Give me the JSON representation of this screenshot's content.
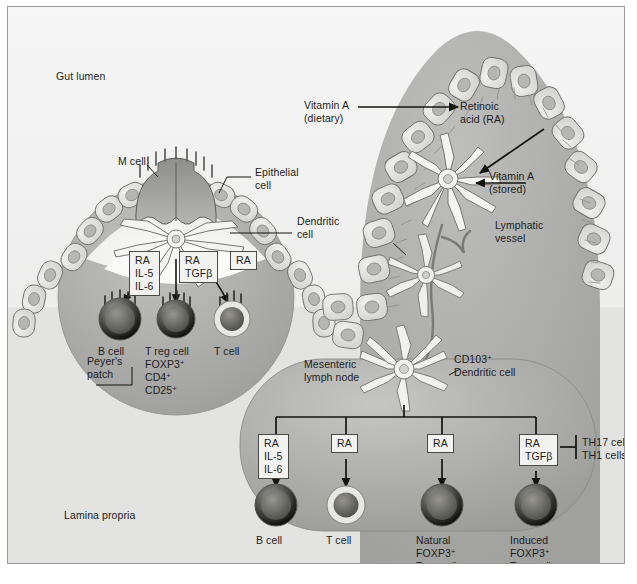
{
  "figure": {
    "regions": {
      "gut_lumen": "Gut lumen",
      "lamina_propria": "Lamina propria",
      "peyers_patch": "Peyer's\npatch",
      "mesenteric_lymph_node": "Mesenteric\nlymph node"
    },
    "callouts": {
      "m_cell": "M cell",
      "epithelial_cell": "Epithelial\ncell",
      "dendritic_cell": "Dendritic\ncell",
      "lymphatic_vessel": "Lymphatic\nvessel",
      "cd103_dendritic_cell": "CD103+\nDendritic cell",
      "vitamin_a_dietary": "Vitamin A\n(dietary)",
      "vitamin_a_stored": "Vitamin A\n(stored)",
      "retinoic_acid": "Retinoic\nacid (RA)"
    },
    "peyers_patch_pathway": {
      "mediator_boxes": [
        {
          "id": "pp-b",
          "lines": [
            "RA",
            "IL-5",
            "IL-6"
          ]
        },
        {
          "id": "pp-treg",
          "lines": [
            "RA",
            "TGFβ"
          ]
        },
        {
          "id": "pp-t",
          "lines": [
            "RA"
          ]
        }
      ],
      "cells": [
        {
          "id": "pp-bcell",
          "lines": [
            "B cell"
          ]
        },
        {
          "id": "pp-tregcell",
          "lines": [
            "T reg cell",
            "FOXP3+",
            "CD4+",
            "CD25+"
          ]
        },
        {
          "id": "pp-tcell",
          "lines": [
            "T cell"
          ]
        }
      ]
    },
    "lymph_node_pathway": {
      "mediator_boxes": [
        {
          "id": "ln-b",
          "lines": [
            "RA",
            "IL-5",
            "IL-6"
          ]
        },
        {
          "id": "ln-t",
          "lines": [
            "RA"
          ]
        },
        {
          "id": "ln-ntreg",
          "lines": [
            "RA"
          ]
        },
        {
          "id": "ln-itreg",
          "lines": [
            "RA",
            "TGFβ"
          ]
        }
      ],
      "cells": [
        {
          "id": "ln-bcell",
          "lines": [
            "B cell"
          ]
        },
        {
          "id": "ln-tcell",
          "lines": [
            "T cell"
          ]
        },
        {
          "id": "ln-ntregcell",
          "lines": [
            "Natural",
            "FOXP3+",
            "Treg cell"
          ]
        },
        {
          "id": "ln-itregcell",
          "lines": [
            "Induced",
            "FOXP3+",
            "Treg cell"
          ]
        }
      ],
      "inhibited": [
        "TH17 cells",
        "TH1 cells"
      ]
    },
    "colors": {
      "background": "#ffffff",
      "frame_border": "#9a9a9a",
      "lumen_tint": "#ececeb",
      "tissue_mid": "#b9b9b7",
      "tissue_dark": "#a3a3a1",
      "epithelium_fill": "#e2e2e0",
      "epithelium_stroke": "#6e6e6c",
      "m_cell_fill": "#9e9e9c",
      "cell_body": "#6e6e6c",
      "ink": "#1c1c1c",
      "box_fill": "#f2f2f1"
    }
  }
}
